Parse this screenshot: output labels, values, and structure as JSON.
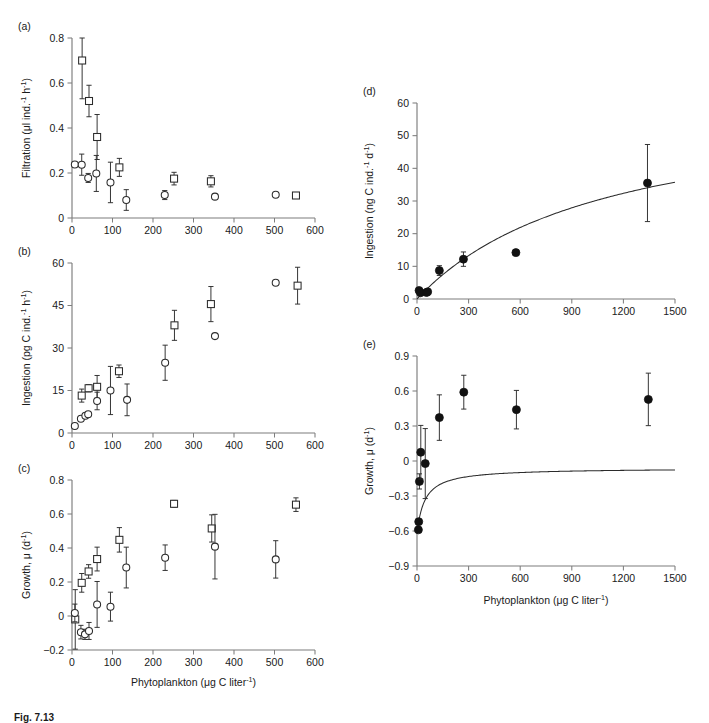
{
  "figure": {
    "caption": "Fig. 7.13",
    "panels": [
      "(a)",
      "(b)",
      "(c)",
      "(d)",
      "(e)"
    ]
  },
  "chart_data": [
    {
      "id": "a",
      "type": "scatter",
      "title": "",
      "panel_letter": "(a)",
      "xlabel": "",
      "ylabel": "Filtration (μl ind.⁻¹ h⁻¹)",
      "xlim": [
        0,
        600
      ],
      "ylim": [
        0,
        0.8
      ],
      "xticks": [
        0,
        100,
        200,
        300,
        400,
        500,
        600
      ],
      "yticks": [
        0,
        0.2,
        0.4,
        0.6,
        0.8
      ],
      "ytick_labels": [
        "0",
        "0.2",
        "0.4",
        "0.6",
        "0.8"
      ],
      "grid": false,
      "legend": "none",
      "series": [
        {
          "name": "squares",
          "marker": "open-square",
          "points": [
            {
              "x": 25,
              "y": 0.7,
              "err": 0.17
            },
            {
              "x": 42,
              "y": 0.52,
              "err": 0.07
            },
            {
              "x": 62,
              "y": 0.36,
              "err": 0.1
            },
            {
              "x": 117,
              "y": 0.225,
              "err": 0.04
            },
            {
              "x": 252,
              "y": 0.175,
              "err": 0.028
            },
            {
              "x": 343,
              "y": 0.163,
              "err": 0.025
            },
            {
              "x": 553,
              "y": 0.1,
              "err": 0.012
            }
          ]
        },
        {
          "name": "circles",
          "marker": "open-circle",
          "points": [
            {
              "x": 7,
              "y": 0.238,
              "err": 0.0
            },
            {
              "x": 24,
              "y": 0.237,
              "err": 0.047
            },
            {
              "x": 40,
              "y": 0.178,
              "err": 0.02
            },
            {
              "x": 60,
              "y": 0.198,
              "err": 0.08
            },
            {
              "x": 95,
              "y": 0.158,
              "err": 0.09
            },
            {
              "x": 134,
              "y": 0.08,
              "err": 0.046
            },
            {
              "x": 229,
              "y": 0.102,
              "err": 0.02
            },
            {
              "x": 353,
              "y": 0.095,
              "err": 0.0
            },
            {
              "x": 503,
              "y": 0.103,
              "err": 0.0
            }
          ]
        }
      ]
    },
    {
      "id": "b",
      "type": "scatter",
      "panel_letter": "(b)",
      "xlabel": "",
      "ylabel": "Ingestion (pg C ind.⁻¹ h⁻¹)",
      "xlim": [
        0,
        600
      ],
      "ylim": [
        0,
        60
      ],
      "xticks": [
        0,
        100,
        200,
        300,
        400,
        500,
        600
      ],
      "yticks": [
        0,
        15,
        30,
        45,
        60
      ],
      "ytick_labels": [
        "0",
        "15",
        "30",
        "45",
        "60"
      ],
      "grid": false,
      "legend": "none",
      "series": [
        {
          "name": "squares",
          "marker": "open-square",
          "points": [
            {
              "x": 24,
              "y": 13.2,
              "err": 2.3
            },
            {
              "x": 41,
              "y": 15.8,
              "err": 1.3
            },
            {
              "x": 62,
              "y": 16.3,
              "err": 4.0
            },
            {
              "x": 116,
              "y": 21.8,
              "err": 2.2
            },
            {
              "x": 253,
              "y": 38.0,
              "err": 5.3
            },
            {
              "x": 343,
              "y": 45.5,
              "err": 6.2
            },
            {
              "x": 557,
              "y": 52.0,
              "err": 6.5
            }
          ]
        },
        {
          "name": "circles",
          "marker": "open-circle",
          "points": [
            {
              "x": 7,
              "y": 2.5,
              "err": 0.0
            },
            {
              "x": 22,
              "y": 5.0,
              "err": 0.0
            },
            {
              "x": 33,
              "y": 6.1,
              "err": 0.0
            },
            {
              "x": 40,
              "y": 6.6,
              "err": 0.0
            },
            {
              "x": 62,
              "y": 11.3,
              "err": 3.1
            },
            {
              "x": 95,
              "y": 15.0,
              "err": 8.5
            },
            {
              "x": 136,
              "y": 11.7,
              "err": 5.6
            },
            {
              "x": 230,
              "y": 24.8,
              "err": 6.2
            },
            {
              "x": 353,
              "y": 34.2,
              "err": 0.0
            },
            {
              "x": 503,
              "y": 53.0,
              "err": 0.0
            }
          ]
        }
      ]
    },
    {
      "id": "c",
      "type": "scatter",
      "panel_letter": "(c)",
      "xlabel": "Phytoplankton (μg C liter⁻¹)",
      "ylabel": "Growth, μ (d⁻¹)",
      "xlim": [
        0,
        600
      ],
      "ylim": [
        -0.2,
        0.8
      ],
      "xticks": [
        0,
        100,
        200,
        300,
        400,
        500,
        600
      ],
      "yticks": [
        -0.2,
        0,
        0.2,
        0.4,
        0.6,
        0.8
      ],
      "ytick_labels": [
        "−0.2",
        "0",
        "0.2",
        "0.4",
        "0.6",
        "0.8"
      ],
      "grid": false,
      "legend": "none",
      "series": [
        {
          "name": "squares",
          "marker": "open-square",
          "points": [
            {
              "x": 8,
              "y": -0.02,
              "err": 0.175
            },
            {
              "x": 24,
              "y": 0.195,
              "err": 0.055
            },
            {
              "x": 41,
              "y": 0.262,
              "err": 0.04
            },
            {
              "x": 62,
              "y": 0.335,
              "err": 0.07
            },
            {
              "x": 117,
              "y": 0.448,
              "err": 0.072
            },
            {
              "x": 252,
              "y": 0.66,
              "err": 0.02
            },
            {
              "x": 345,
              "y": 0.515,
              "err": 0.08
            },
            {
              "x": 553,
              "y": 0.655,
              "err": 0.04
            }
          ]
        },
        {
          "name": "circles",
          "marker": "open-circle",
          "points": [
            {
              "x": 7,
              "y": 0.018,
              "err": 0.052
            },
            {
              "x": 22,
              "y": -0.095,
              "err": 0.04
            },
            {
              "x": 32,
              "y": -0.108,
              "err": 0.03
            },
            {
              "x": 42,
              "y": -0.088,
              "err": 0.05
            },
            {
              "x": 62,
              "y": 0.068,
              "err": 0.135
            },
            {
              "x": 95,
              "y": 0.055,
              "err": 0.085
            },
            {
              "x": 134,
              "y": 0.285,
              "err": 0.12
            },
            {
              "x": 230,
              "y": 0.343,
              "err": 0.075
            },
            {
              "x": 353,
              "y": 0.408,
              "err": 0.19
            },
            {
              "x": 503,
              "y": 0.333,
              "err": 0.11
            }
          ]
        }
      ]
    },
    {
      "id": "d",
      "type": "scatter",
      "panel_letter": "(d)",
      "xlabel": "",
      "ylabel": "Ingestion (ng C ind.⁻¹ d⁻¹)",
      "xlim": [
        0,
        1500
      ],
      "ylim": [
        0,
        60
      ],
      "xticks": [
        0,
        300,
        600,
        900,
        1200,
        1500
      ],
      "yticks": [
        0,
        10,
        20,
        30,
        40,
        50,
        60
      ],
      "ytick_labels": [
        "0",
        "10",
        "20",
        "30",
        "40",
        "50",
        "60"
      ],
      "grid": false,
      "legend": "none",
      "curve": {
        "type": "saturating",
        "Imax": 62,
        "K": 1100
      },
      "series": [
        {
          "name": "filled",
          "marker": "filled-circle",
          "points": [
            {
              "x": 12,
              "y": 2.6,
              "err": 0.0
            },
            {
              "x": 20,
              "y": 1.9,
              "err": 0.0
            },
            {
              "x": 55,
              "y": 2.0,
              "err": 0.0
            },
            {
              "x": 62,
              "y": 2.2,
              "err": 0.0
            },
            {
              "x": 130,
              "y": 8.7,
              "err": 1.5
            },
            {
              "x": 270,
              "y": 12.2,
              "err": 2.2
            },
            {
              "x": 575,
              "y": 14.2,
              "err": 0.0
            },
            {
              "x": 1340,
              "y": 35.5,
              "err": 11.8
            }
          ]
        }
      ]
    },
    {
      "id": "e",
      "type": "scatter",
      "panel_letter": "(e)",
      "xlabel": "Phytoplankton (μg C liter⁻¹)",
      "ylabel": "Growth, μ (d⁻¹)",
      "xlim": [
        0,
        1500
      ],
      "ylim": [
        -0.9,
        0.9
      ],
      "xticks": [
        0,
        300,
        600,
        900,
        1200,
        1500
      ],
      "yticks": [
        -0.9,
        -0.6,
        -0.3,
        0,
        0.3,
        0.6,
        0.9
      ],
      "ytick_labels": [
        "−0.9",
        "−0.6",
        "−0.3",
        "0",
        "0.3",
        "0.6",
        "0.9"
      ],
      "grid": false,
      "legend": "none",
      "curve": {
        "type": "monod",
        "mumax": 0.56,
        "K": 45,
        "m": 0.62
      },
      "series": [
        {
          "name": "filled",
          "marker": "filled-circle",
          "points": [
            {
              "x": 8,
              "y": -0.59,
              "err": 0.0
            },
            {
              "x": 10,
              "y": -0.52,
              "err": 0.0
            },
            {
              "x": 14,
              "y": -0.175,
              "err": 0.065
            },
            {
              "x": 22,
              "y": 0.075,
              "err": 0.23
            },
            {
              "x": 48,
              "y": -0.022,
              "err": 0.3
            },
            {
              "x": 130,
              "y": 0.372,
              "err": 0.195
            },
            {
              "x": 272,
              "y": 0.59,
              "err": 0.145
            },
            {
              "x": 578,
              "y": 0.44,
              "err": 0.165
            },
            {
              "x": 1345,
              "y": 0.528,
              "err": 0.225
            }
          ]
        }
      ]
    }
  ]
}
